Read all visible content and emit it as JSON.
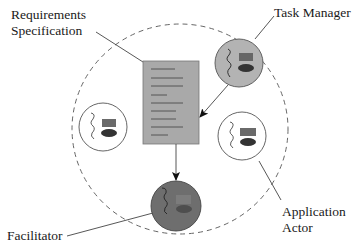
{
  "labels": {
    "requirements": [
      "Requirements",
      "Specification"
    ],
    "task_manager": "Task Manager",
    "application_actor": [
      "Application",
      "Actor"
    ],
    "facilitator": "Facilitator"
  },
  "colors": {
    "background": "#ffffff",
    "stroke": "#444444",
    "document_fill": "#a9a9a9",
    "document_lines": "#5a5a5a",
    "task_manager_fill": "#b3b3b3",
    "facilitator_fill": "#6e6e6e",
    "actor_fill": "#ffffff",
    "rect_glyph": "#6a6a6a",
    "ellipse_glyph": "#333333"
  },
  "nodes": [
    {
      "id": "requirements-specification",
      "type": "document",
      "x": 143,
      "y": 61,
      "w": 56,
      "h": 83
    },
    {
      "id": "task-manager",
      "type": "agent",
      "cx": 239,
      "cy": 63,
      "r": 24
    },
    {
      "id": "application-actor-left",
      "type": "agent",
      "cx": 103,
      "cy": 127,
      "r": 24
    },
    {
      "id": "application-actor-right",
      "type": "agent",
      "cx": 242,
      "cy": 136,
      "r": 24
    },
    {
      "id": "facilitator",
      "type": "agent",
      "cx": 176,
      "cy": 206,
      "r": 25
    }
  ],
  "edges": [
    {
      "from": "task-manager",
      "to": "requirements-specification",
      "arrow": true
    },
    {
      "from": "requirements-specification",
      "to": "facilitator",
      "arrow": true
    }
  ],
  "boundary": {
    "type": "dashed-circle",
    "cx": 180,
    "cy": 128,
    "r": 106
  }
}
